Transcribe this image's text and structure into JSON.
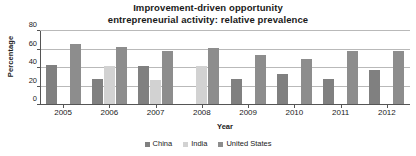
{
  "chart_data": {
    "type": "bar",
    "title": "Improvement-driven opportunity entrepreneurial activity: relative prevalence",
    "title_lines": [
      "Improvement-driven opportunity",
      "entrepreneurial activity: relative prevalence"
    ],
    "xlabel": "Year",
    "ylabel": "Percentage",
    "ylim": [
      0,
      80
    ],
    "yticks": [
      0,
      20,
      40,
      60,
      80
    ],
    "ytick_labels": [
      "0",
      "20",
      "40",
      "60",
      "80"
    ],
    "grid": true,
    "legend_position": "bottom",
    "categories": [
      "2005",
      "2006",
      "2007",
      "2008",
      "2009",
      "2010",
      "2011",
      "2012"
    ],
    "series": [
      {
        "name": "China",
        "color": "#808080",
        "values": [
          43,
          28,
          42,
          null,
          28,
          33,
          28,
          38
        ]
      },
      {
        "name": "India",
        "color": "#d2d2d2",
        "values": [
          null,
          42,
          27,
          42,
          null,
          null,
          null,
          null
        ]
      },
      {
        "name": "United States",
        "color": "#8d8d8d",
        "values": [
          66,
          63,
          58,
          62,
          54,
          50,
          58,
          58
        ]
      }
    ]
  },
  "legend": {
    "items": [
      {
        "label": "China",
        "color": "#808080"
      },
      {
        "label": "India",
        "color": "#d2d2d2"
      },
      {
        "label": "United States",
        "color": "#8d8d8d"
      }
    ]
  },
  "colors": {
    "china": "#808080",
    "india": "#d2d2d2",
    "united_states": "#8d8d8d",
    "axis": "#555555",
    "gridline": "#b9b9b9",
    "text": "#1a1a1a",
    "background": "#ffffff"
  }
}
